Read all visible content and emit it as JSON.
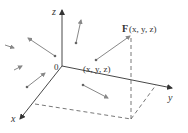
{
  "figure": {
    "type": "3d-vector-field",
    "axes": {
      "x_label": "x",
      "y_label": "y",
      "z_label": "z",
      "origin_label": "0"
    },
    "point_label": "(x, y, z)",
    "vector_label_bold": "F",
    "vector_label_args": "(x, y, z)",
    "colors": {
      "axis": "#333333",
      "vector": "#888888",
      "dashed": "#555555",
      "text": "#333333"
    },
    "vectors_count": 7
  }
}
